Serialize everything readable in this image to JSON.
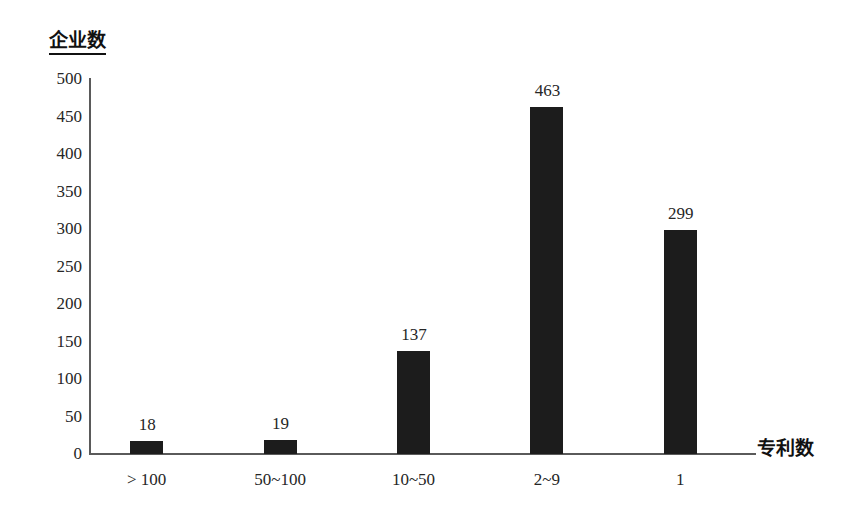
{
  "chart_data": {
    "type": "bar",
    "title": "",
    "subtitle": "",
    "xlabel": "专利数",
    "ylabel": "企业数",
    "categories": [
      "> 100",
      "50~100",
      "10~50",
      "2~9",
      "1"
    ],
    "values": [
      18,
      19,
      137,
      463,
      299
    ],
    "value_labels": [
      "18",
      "19",
      "137",
      "463",
      "299"
    ],
    "ylim": [
      0,
      500
    ],
    "y_ticks": [
      0,
      50,
      100,
      150,
      200,
      250,
      300,
      350,
      400,
      450,
      500
    ],
    "y_tick_labels": [
      "0",
      "50",
      "100",
      "150",
      "200",
      "250",
      "300",
      "350",
      "400",
      "450",
      "500"
    ],
    "grid": false,
    "legend": false,
    "legend_position": "none",
    "bar_color": "#1c1c1c",
    "axis_color": "#5a5a5a",
    "background_color": "#ffffff",
    "text_color": "#262626"
  },
  "axes": {
    "y_title": "企业数",
    "x_title": "专利数"
  }
}
